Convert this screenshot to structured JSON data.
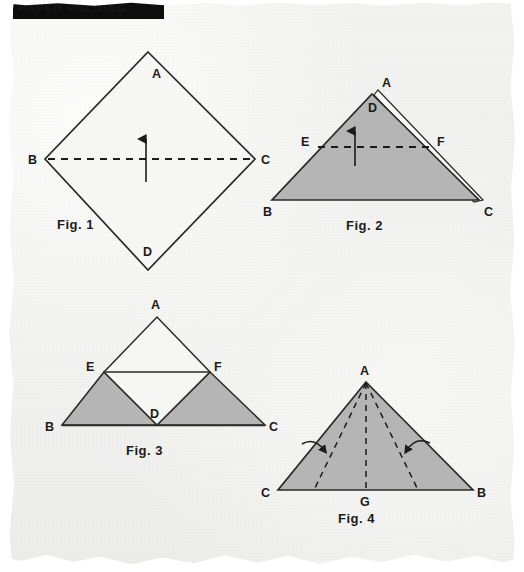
{
  "page": {
    "background_color": "#f1f1ef",
    "paper_edge": "torn-scanned-edges"
  },
  "header_band": {
    "text": "PAPER FOLDING",
    "background_color": "#0d0d0d",
    "text_color": "#151515"
  },
  "colors": {
    "ink": "#1b1b1b",
    "fill_gray": "#b5b5b5",
    "fill_white": "#f4f4f2"
  },
  "figures": [
    {
      "id": "fig1",
      "caption": "Fig. 1",
      "shape": "square-rotated-diamond",
      "fill": "white",
      "vertices": [
        {
          "label": "A",
          "x": 148,
          "y": 52,
          "label_x": 152,
          "label_y": 78
        },
        {
          "label": "B",
          "x": 45,
          "y": 159,
          "label_x": 30,
          "label_y": 164
        },
        {
          "label": "C",
          "x": 255,
          "y": 159,
          "label_x": 262,
          "label_y": 164
        },
        {
          "label": "D",
          "x": 148,
          "y": 270,
          "label_x": 144,
          "label_y": 256
        }
      ],
      "fold_line": {
        "from": "B",
        "to": "C",
        "style": "dashed",
        "orientation": "horizontal"
      },
      "arrow": {
        "direction": "up",
        "x": 146,
        "from_y": 180,
        "to_y": 140
      },
      "caption_x": 58,
      "caption_y": 226
    },
    {
      "id": "fig2",
      "caption": "Fig. 2",
      "shape": "triangle-folded-up",
      "fill": "gray",
      "vertices": [
        {
          "label": "A",
          "x": 378,
          "y": 92,
          "label_x": 384,
          "label_y": 87
        },
        {
          "label": "D",
          "x": 372,
          "y": 95,
          "label_x": 370,
          "label_y": 111
        },
        {
          "label": "B",
          "x": 272,
          "y": 200,
          "label_x": 264,
          "label_y": 215
        },
        {
          "label": "C",
          "x": 483,
          "y": 200,
          "label_x": 486,
          "label_y": 215
        },
        {
          "label": "E",
          "x": 318,
          "y": 147,
          "label_x": 303,
          "label_y": 145
        },
        {
          "label": "F",
          "x": 433,
          "y": 147,
          "label_x": 438,
          "label_y": 145
        }
      ],
      "fold_line": {
        "from": "E",
        "to": "F",
        "style": "dashed",
        "orientation": "horizontal"
      },
      "arrow": {
        "direction": "down",
        "x": 355,
        "from_y": 133,
        "to_y": 163
      },
      "caption_x": 348,
      "caption_y": 226
    },
    {
      "id": "fig3",
      "caption": "Fig. 3",
      "shape": "triangle-with-folded-corners",
      "fill": "gray-and-white",
      "vertices": [
        {
          "label": "A",
          "x": 157,
          "y": 317,
          "label_x": 152,
          "label_y": 308
        },
        {
          "label": "E",
          "x": 104,
          "y": 372,
          "label_x": 88,
          "label_y": 370
        },
        {
          "label": "F",
          "x": 210,
          "y": 372,
          "label_x": 215,
          "label_y": 370
        },
        {
          "label": "D",
          "x": 157,
          "y": 425,
          "label_x": 150,
          "label_y": 417
        },
        {
          "label": "B",
          "x": 62,
          "y": 425,
          "label_x": 47,
          "label_y": 430
        },
        {
          "label": "C",
          "x": 265,
          "y": 425,
          "label_x": 270,
          "label_y": 430
        }
      ],
      "caption_x": 128,
      "caption_y": 452
    },
    {
      "id": "fig4",
      "caption": "Fig. 4",
      "shape": "triangle-with-three-fold-lines",
      "fill": "gray",
      "vertices": [
        {
          "label": "A",
          "x": 366,
          "y": 382,
          "label_x": 361,
          "label_y": 373
        },
        {
          "label": "C",
          "x": 278,
          "y": 490,
          "label_x": 263,
          "label_y": 496
        },
        {
          "label": "B",
          "x": 473,
          "y": 490,
          "label_x": 478,
          "label_y": 496
        },
        {
          "label": "G",
          "x": 366,
          "y": 490,
          "label_x": 361,
          "label_y": 505
        }
      ],
      "fold_lines": [
        {
          "from": "A",
          "to_x": 314,
          "to_y": 490,
          "style": "dashed"
        },
        {
          "from": "A",
          "to_x": 366,
          "to_y": 490,
          "style": "dashed"
        },
        {
          "from": "A",
          "to_x": 418,
          "to_y": 490,
          "style": "dashed"
        }
      ],
      "curved_arrows": [
        {
          "direction": "right",
          "x": 320,
          "y": 448
        },
        {
          "direction": "left",
          "x": 412,
          "y": 448
        }
      ],
      "caption_x": 340,
      "caption_y": 520
    }
  ]
}
